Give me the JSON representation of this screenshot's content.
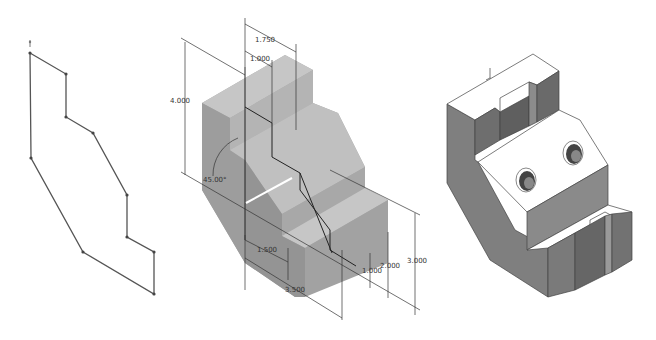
{
  "figure": {
    "panels": [
      {
        "id": "sketch-profile",
        "description": "2D sketch profile with vertices"
      },
      {
        "id": "dimensioned-extrusion",
        "description": "Shaded isometric part with dimensions"
      },
      {
        "id": "finished-part",
        "description": "Finished isometric part with two holes and slots"
      }
    ]
  },
  "dimensions": {
    "d_1750": "1.750",
    "d_1000_top": "1.000",
    "d_4000": "4.000",
    "d_angle": "45.00°",
    "d_1500": "1.500",
    "d_3500": "3.500",
    "d_1000_right": "1.000",
    "d_2000": "2.000",
    "d_3000": "3.000"
  },
  "colors": {
    "sketch_line": "#555555",
    "part_face_light": "#c6c6c6",
    "part_face_mid": "#ababab",
    "part_face_dark": "#8e8e8e",
    "finished_top": "#ffffff",
    "finished_side": "#7f7f7f",
    "dimension_line": "#333333"
  }
}
